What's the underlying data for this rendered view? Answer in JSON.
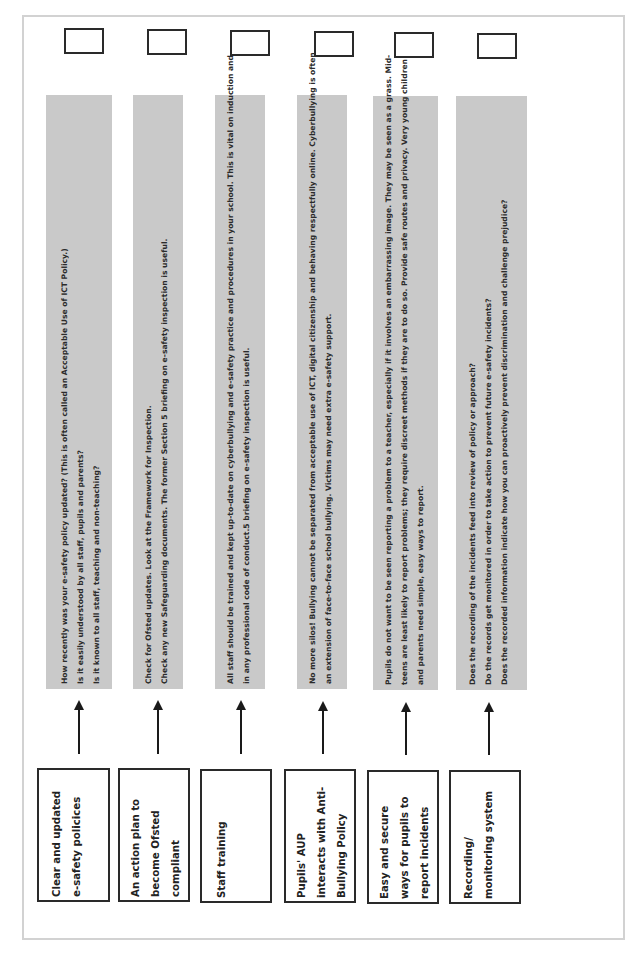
{
  "document": {
    "orientation": "rotated-90-ccw",
    "colors": {
      "gray_panel": "#c9c9c9",
      "border": "#2a2a2a",
      "frame": "#d2d2d2"
    }
  },
  "rows": [
    {
      "label_lines": [
        "Clear and updated",
        "e-safety policices"
      ],
      "detail_lines": [
        "How recently was your e-safety policy updated?  (This is often called an Acceptable Use of ICT Policy.)",
        "Is it easily understood by all staff, pupils and parents?",
        "Is it known to all staff, teaching and non-teaching?"
      ]
    },
    {
      "label_lines": [
        "An action plan to",
        "become Ofsted",
        "compliant"
      ],
      "detail_lines": [
        "Check for Ofsted updates. Look at the Framework for Inspection.",
        "Check any new Safeguarding documents. The former Section 5 briefing on e-safety inspection is useful."
      ]
    },
    {
      "label_lines": [
        "Staff training"
      ],
      "detail_lines": [
        "All staff should be trained and kept up-to-date on cyberbullying and e-safety practice and procedures in your school. This is vital on induction and",
        "in any professional code of conduct.5 briefing on e-safety inspection is useful."
      ]
    },
    {
      "label_lines": [
        "Pupils' AUP",
        "interacts with Anti-",
        "Bullying Policy"
      ],
      "detail_lines": [
        "No more silos! Bullying cannot be separated from acceptable use of ICT, digital citizenship and behaving respectfully online. Cyberbullying is often",
        "an extension of face-to-face school bullying. Victims may need extra e-safety support."
      ]
    },
    {
      "label_lines": [
        "Easy and secure",
        "ways for pupils to",
        "report incidents"
      ],
      "detail_lines": [
        "Pupils do not want to be seen reporting a problem to a teacher, especially if it involves an embarrassing image. They may be seen as a grass. Mid-",
        "teens are least likely to report problems; they require discreet methods if they are to do so. Provide safe routes and privacy. Very young children",
        "and parents need simple, easy ways to report."
      ]
    },
    {
      "label_lines": [
        "Recording/",
        "monitoring system"
      ],
      "detail_lines": [
        "Does the recording of the incidents feed into review of policy or approach?",
        "Do the records get monitored in order to take action to prevent future e-safety incidents?",
        "Does the recorded information indicate how you can proactively prevent discrimination and challenge prejudice?"
      ]
    }
  ]
}
